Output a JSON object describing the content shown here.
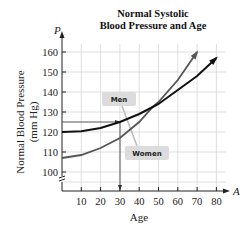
{
  "chart_data": {
    "type": "line",
    "title": "Normal Systolic Blood Pressure and Age",
    "title_lines": [
      "Normal Systolic",
      "Blood Pressure and Age"
    ],
    "xlabel": "Age",
    "ylabel": "Normal Blood Pressure (mm Hg)",
    "ylabel_lines": [
      "Normal Blood Pressure",
      "(mm Hg)"
    ],
    "x_var": "A",
    "y_var": "P",
    "xlim": [
      0,
      85
    ],
    "ylim": [
      100,
      160
    ],
    "xticks": [
      10,
      20,
      30,
      40,
      50,
      60,
      70,
      80
    ],
    "yticks": [
      100,
      110,
      120,
      130,
      140,
      150,
      160
    ],
    "grid": true,
    "axis_break_y": true,
    "series": [
      {
        "name": "Men",
        "color": "#111111",
        "x": [
          0,
          10,
          20,
          30,
          40,
          47,
          50,
          60,
          70,
          80
        ],
        "values": [
          120,
          120.4,
          122,
          125,
          129,
          132.5,
          134,
          141,
          148,
          157
        ]
      },
      {
        "name": "Women",
        "color": "#555555",
        "x": [
          0,
          10,
          20,
          30,
          40,
          47,
          50,
          60,
          70
        ],
        "values": [
          107,
          108.5,
          112,
          117,
          125,
          132.5,
          135,
          146,
          160
        ]
      }
    ],
    "annotations": [
      {
        "type": "reference_line",
        "from": [
          30,
          100
        ],
        "to": [
          30,
          125
        ],
        "note": "vertical line at age 30 down to x-axis"
      },
      {
        "type": "reference_line",
        "from": [
          0,
          125
        ],
        "to": [
          30,
          125
        ],
        "note": "horizontal line at 125 mm Hg to Men curve"
      },
      {
        "type": "label",
        "text": "Men",
        "near_series": "Men"
      },
      {
        "type": "label",
        "text": "Women",
        "near_series": "Women"
      }
    ]
  },
  "labels": {
    "title_1": "Normal Systolic",
    "title_2": "Blood Pressure and Age",
    "ylabel_1": "Normal Blood Pressure",
    "ylabel_2": "(mm Hg)",
    "xlabel": "Age",
    "x_var": "A",
    "y_var": "P",
    "men": "Men",
    "women": "Women"
  }
}
